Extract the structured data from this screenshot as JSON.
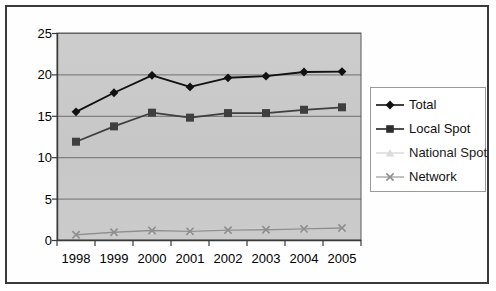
{
  "chart_data": {
    "type": "line",
    "title": "",
    "subtitle": "",
    "xlabel": "",
    "ylabel": "",
    "categories": [
      "1998",
      "1999",
      "2000",
      "2001",
      "2002",
      "2003",
      "2004",
      "2005"
    ],
    "x": [
      1998,
      1999,
      2000,
      2001,
      2002,
      2003,
      2004,
      2005
    ],
    "ylim": [
      0,
      25
    ],
    "yticks": [
      0,
      5,
      10,
      15,
      20,
      25
    ],
    "grid": true,
    "legend_position": "right",
    "plot_background": "#c9c9c9",
    "series": [
      {
        "name": "Total",
        "marker": "diamond",
        "color": "#111111",
        "values": [
          15.5,
          17.8,
          19.9,
          18.5,
          19.6,
          19.8,
          20.3,
          20.35
        ]
      },
      {
        "name": "Local Spot",
        "marker": "square",
        "color": "#3f3f3f",
        "values": [
          11.9,
          13.75,
          15.4,
          14.8,
          15.35,
          15.35,
          15.75,
          16.05
        ]
      },
      {
        "name": "National Spot",
        "marker": "triangle",
        "color": "#d8d8d8",
        "values": [
          0.75,
          1.0,
          1.2,
          1.15,
          1.3,
          1.35,
          1.4,
          1.5
        ]
      },
      {
        "name": "Network",
        "marker": "x",
        "color": "#8f8f8f",
        "values": [
          0.7,
          1.0,
          1.2,
          1.1,
          1.25,
          1.3,
          1.4,
          1.5
        ]
      }
    ]
  },
  "legend": {
    "items": [
      {
        "label": "Total",
        "marker": "diamond-marker-icon"
      },
      {
        "label": "Local Spot",
        "marker": "square-marker-icon"
      },
      {
        "label": "National Spot",
        "marker": "triangle-marker-icon"
      },
      {
        "label": "Network",
        "marker": "x-marker-icon"
      }
    ]
  },
  "axes": {
    "y_tick_labels": [
      "25",
      "20",
      "15",
      "10",
      "5",
      "0"
    ],
    "x_tick_labels": [
      "1998",
      "1999",
      "2000",
      "2001",
      "2002",
      "2003",
      "2004",
      "2005"
    ]
  }
}
